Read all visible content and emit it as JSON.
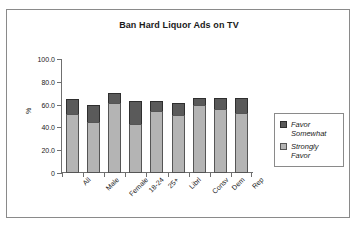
{
  "chart_data": {
    "type": "bar",
    "subtype": "stacked-column",
    "title": "Ban Hard Liquor Ads on TV",
    "xlabel": "",
    "ylabel": "%",
    "ylim": [
      0,
      100
    ],
    "yticks": [
      "0",
      "20.0",
      "40.0",
      "60.0",
      "80.0",
      "100.0"
    ],
    "ytick_values": [
      0,
      20,
      40,
      60,
      80,
      100
    ],
    "grid": false,
    "legend_position": "right",
    "categories": [
      "All",
      "Male",
      "Female",
      "18-24",
      "25+",
      "Librl",
      "Consv",
      "Dem",
      "Rep"
    ],
    "series": [
      {
        "name": "Strongly Favor",
        "color": "#b4b4b4",
        "values": [
          52,
          45,
          61,
          43,
          54,
          51,
          60,
          56,
          53
        ]
      },
      {
        "name": "Favor Somewhat",
        "color": "#5a5a5a",
        "values": [
          13,
          15,
          9,
          20,
          9,
          10,
          6,
          10,
          13
        ]
      }
    ],
    "totals": [
      65,
      60,
      70,
      63,
      63,
      61,
      66,
      66,
      66
    ],
    "legend": [
      {
        "label": "Favor Somewhat",
        "color": "#5a5a5a"
      },
      {
        "label": "Strongly Favor",
        "color": "#b4b4b4"
      }
    ]
  },
  "colors": {
    "favor_somewhat": "#5a5a5a",
    "strongly_favor": "#b4b4b4",
    "axis": "#6f6f6f",
    "frame": "#8a8a8a",
    "text": "#1a1a1a",
    "background": "#ffffff"
  }
}
